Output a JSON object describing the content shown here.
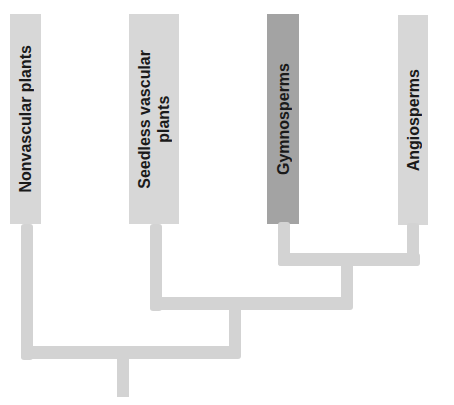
{
  "diagram": {
    "type": "cladogram",
    "colors": {
      "branch": "#d3d3d3",
      "box_default": "#d7d7d7",
      "box_highlight": "#a3a3a3",
      "text": "#1a1a1a"
    },
    "taxa": [
      {
        "label": "Nonvascular plants",
        "highlighted": false
      },
      {
        "label": "Seedless vascular\nplants",
        "highlighted": false
      },
      {
        "label": "Gymnosperms",
        "highlighted": true
      },
      {
        "label": "Angiosperms",
        "highlighted": false
      }
    ]
  }
}
